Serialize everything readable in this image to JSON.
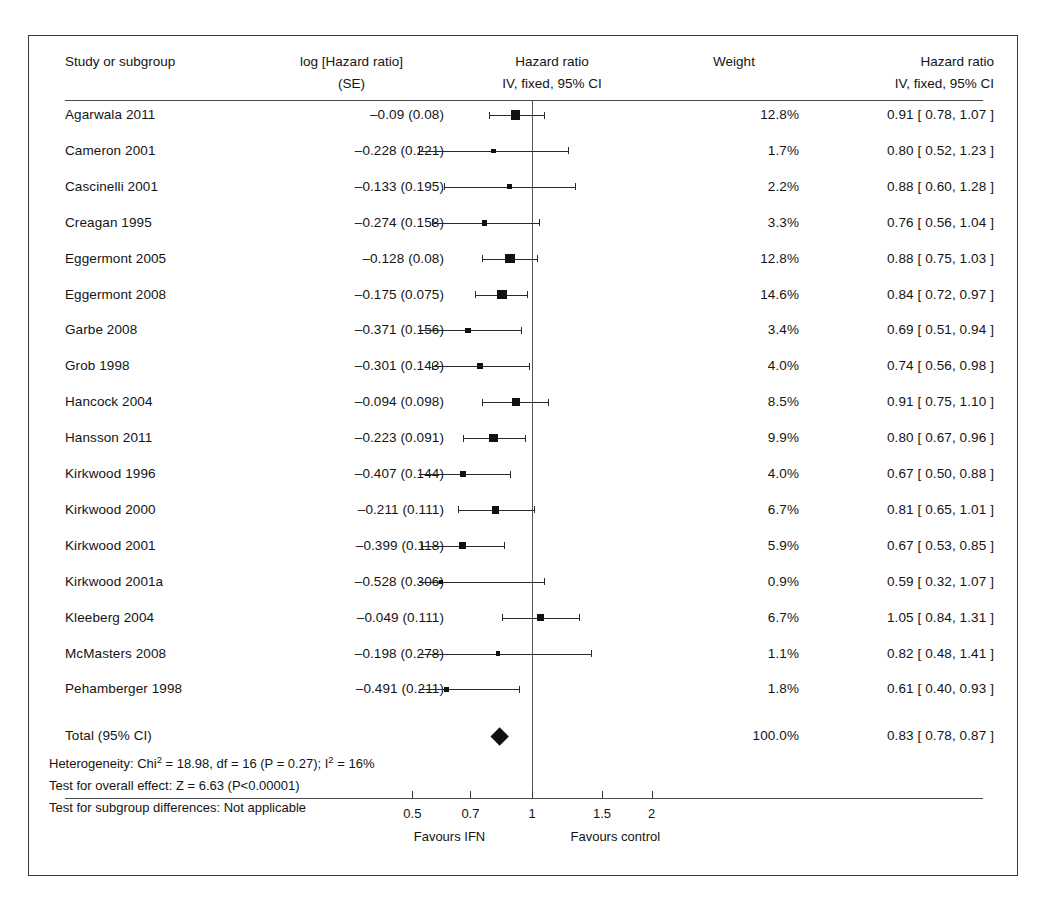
{
  "figure": {
    "type": "forest-plot",
    "columns": {
      "study": "Study or subgroup",
      "log_line1": "log [Hazard ratio]",
      "log_line2": "(SE)",
      "plot_line1": "Hazard ratio",
      "plot_line2": "IV, fixed, 95% CI",
      "weight": "Weight",
      "hr_line1": "Hazard ratio",
      "hr_line2": "IV, fixed, 95% CI"
    },
    "axis": {
      "ticks": [
        "0.5",
        "0.7",
        "1",
        "1.5",
        "2"
      ],
      "tick_values": [
        0.5,
        0.7,
        1,
        1.5,
        2
      ],
      "favours_left": "Favours IFN",
      "favours_right": "Favours control",
      "null_value": 1
    },
    "summary": {
      "total_label": "Total (95% CI)",
      "total_weight": "100.0%",
      "total_hr": "0.83 [ 0.78, 0.87 ]",
      "heterogeneity": "Heterogeneity: Chi² = 18.98, df = 16 (P = 0.27); I² = 16%",
      "overall_effect": "Test for overall effect: Z = 6.63 (P<0.00001)",
      "subgroup_diff": "Test for subgroup differences: Not applicable"
    }
  },
  "chart_data": {
    "type": "forest",
    "title": "Hazard ratio",
    "subtitle": "IV, fixed, 95% CI",
    "xlabel": "",
    "ylabel": "",
    "xscale": "log",
    "xlim": [
      0.38,
      2.6
    ],
    "xticks": [
      0.5,
      0.7,
      1,
      1.5,
      2
    ],
    "xticklabels": [
      "0.5",
      "0.7",
      "1",
      "1.5",
      "2"
    ],
    "grid": false,
    "legend": "none",
    "null_line": 1,
    "annotations": [
      "Favours IFN",
      "Favours control"
    ],
    "studies": [
      {
        "label": "Agarwala 2011",
        "log_se": "–0.09 (0.08)",
        "log": -0.09,
        "se": 0.08,
        "weight": "12.8%",
        "weight_value": 12.8,
        "hr_text": "0.91 [ 0.78, 1.07 ]",
        "hr": 0.91,
        "lcl": 0.78,
        "ucl": 1.07
      },
      {
        "label": "Cameron 2001",
        "log_se": "–0.228 (0.221)",
        "log": -0.228,
        "se": 0.221,
        "weight": "1.7%",
        "weight_value": 1.7,
        "hr_text": "0.80 [ 0.52, 1.23 ]",
        "hr": 0.8,
        "lcl": 0.52,
        "ucl": 1.23
      },
      {
        "label": "Cascinelli 2001",
        "log_se": "–0.133 (0.195)",
        "log": -0.133,
        "se": 0.195,
        "weight": "2.2%",
        "weight_value": 2.2,
        "hr_text": "0.88 [ 0.60, 1.28 ]",
        "hr": 0.88,
        "lcl": 0.6,
        "ucl": 1.28
      },
      {
        "label": "Creagan 1995",
        "log_se": "–0.274 (0.158)",
        "log": -0.274,
        "se": 0.158,
        "weight": "3.3%",
        "weight_value": 3.3,
        "hr_text": "0.76 [ 0.56, 1.04 ]",
        "hr": 0.76,
        "lcl": 0.56,
        "ucl": 1.04
      },
      {
        "label": "Eggermont 2005",
        "log_se": "–0.128 (0.08)",
        "log": -0.128,
        "se": 0.08,
        "weight": "12.8%",
        "weight_value": 12.8,
        "hr_text": "0.88 [ 0.75, 1.03 ]",
        "hr": 0.88,
        "lcl": 0.75,
        "ucl": 1.03
      },
      {
        "label": "Eggermont 2008",
        "log_se": "–0.175 (0.075)",
        "log": -0.175,
        "se": 0.075,
        "weight": "14.6%",
        "weight_value": 14.6,
        "hr_text": "0.84 [ 0.72, 0.97 ]",
        "hr": 0.84,
        "lcl": 0.72,
        "ucl": 0.97
      },
      {
        "label": "Garbe 2008",
        "log_se": "–0.371 (0.156)",
        "log": -0.371,
        "se": 0.156,
        "weight": "3.4%",
        "weight_value": 3.4,
        "hr_text": "0.69 [ 0.51, 0.94 ]",
        "hr": 0.69,
        "lcl": 0.51,
        "ucl": 0.94
      },
      {
        "label": "Grob 1998",
        "log_se": "–0.301 (0.143)",
        "log": -0.301,
        "se": 0.143,
        "weight": "4.0%",
        "weight_value": 4.0,
        "hr_text": "0.74 [ 0.56, 0.98 ]",
        "hr": 0.74,
        "lcl": 0.56,
        "ucl": 0.98
      },
      {
        "label": "Hancock 2004",
        "log_se": "–0.094 (0.098)",
        "log": -0.094,
        "se": 0.098,
        "weight": "8.5%",
        "weight_value": 8.5,
        "hr_text": "0.91 [ 0.75, 1.10 ]",
        "hr": 0.91,
        "lcl": 0.75,
        "ucl": 1.1
      },
      {
        "label": "Hansson 2011",
        "log_se": "–0.223 (0.091)",
        "log": -0.223,
        "se": 0.091,
        "weight": "9.9%",
        "weight_value": 9.9,
        "hr_text": "0.80 [ 0.67, 0.96 ]",
        "hr": 0.8,
        "lcl": 0.67,
        "ucl": 0.96
      },
      {
        "label": "Kirkwood 1996",
        "log_se": "–0.407 (0.144)",
        "log": -0.407,
        "se": 0.144,
        "weight": "4.0%",
        "weight_value": 4.0,
        "hr_text": "0.67 [ 0.50, 0.88 ]",
        "hr": 0.67,
        "lcl": 0.5,
        "ucl": 0.88
      },
      {
        "label": "Kirkwood 2000",
        "log_se": "–0.211 (0.111)",
        "log": -0.211,
        "se": 0.111,
        "weight": "6.7%",
        "weight_value": 6.7,
        "hr_text": "0.81 [ 0.65, 1.01 ]",
        "hr": 0.81,
        "lcl": 0.65,
        "ucl": 1.01
      },
      {
        "label": "Kirkwood 2001",
        "log_se": "–0.399 (0.118)",
        "log": -0.399,
        "se": 0.118,
        "weight": "5.9%",
        "weight_value": 5.9,
        "hr_text": "0.67 [ 0.53, 0.85 ]",
        "hr": 0.67,
        "lcl": 0.53,
        "ucl": 0.85
      },
      {
        "label": "Kirkwood 2001a",
        "log_se": "–0.528 (0.306)",
        "log": -0.528,
        "se": 0.306,
        "weight": "0.9%",
        "weight_value": 0.9,
        "hr_text": "0.59 [ 0.32, 1.07 ]",
        "hr": 0.59,
        "lcl": 0.32,
        "ucl": 1.07
      },
      {
        "label": "Kleeberg 2004",
        "log_se": "–0.049 (0.111)",
        "log": -0.049,
        "se": 0.111,
        "weight": "6.7%",
        "weight_value": 6.7,
        "hr_text": "1.05 [ 0.84, 1.31 ]",
        "hr": 1.05,
        "lcl": 0.84,
        "ucl": 1.31
      },
      {
        "label": "McMasters 2008",
        "log_se": "–0.198 (0.278)",
        "log": -0.198,
        "se": 0.278,
        "weight": "1.1%",
        "weight_value": 1.1,
        "hr_text": "0.82 [ 0.48, 1.41 ]",
        "hr": 0.82,
        "lcl": 0.48,
        "ucl": 1.41
      },
      {
        "label": "Pehamberger 1998",
        "log_se": "–0.491 (0.211)",
        "log": -0.491,
        "se": 0.211,
        "weight": "1.8%",
        "weight_value": 1.8,
        "hr_text": "0.61 [ 0.40, 0.93 ]",
        "hr": 0.61,
        "lcl": 0.4,
        "ucl": 0.93
      }
    ],
    "total": {
      "label": "Total (95% CI)",
      "weight": "100.0%",
      "hr_text": "0.83 [ 0.78, 0.87 ]",
      "hr": 0.83,
      "lcl": 0.78,
      "ucl": 0.87
    }
  }
}
